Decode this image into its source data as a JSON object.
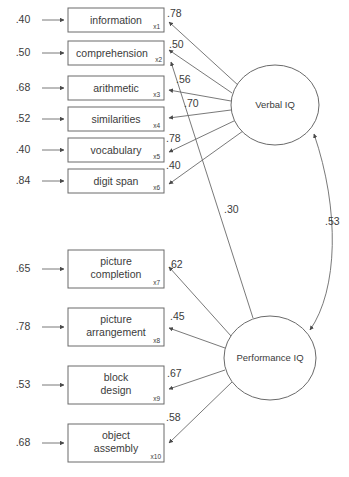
{
  "diagram": {
    "type": "sem-path-diagram",
    "colors": {
      "stroke": "#6a6a6a",
      "text": "#3b3b3b",
      "background": "#ffffff"
    },
    "factors": [
      {
        "id": "verbal",
        "label": "Verbal IQ",
        "cx": 275,
        "cy": 105,
        "rx": 44,
        "ry": 40
      },
      {
        "id": "performance",
        "label": "Performance IQ",
        "cx": 270,
        "cy": 358,
        "rx": 46,
        "ry": 42
      }
    ],
    "indicators": [
      {
        "id": "x1",
        "label": "information",
        "label2": "",
        "sub": "x1",
        "residual": ".40",
        "loading": ".78",
        "x": 68,
        "y": 8,
        "w": 96,
        "h": 24
      },
      {
        "id": "x2",
        "label": "comprehension",
        "label2": "",
        "sub": "x2",
        "residual": ".50",
        "loading": ".50",
        "x": 68,
        "y": 41,
        "w": 96,
        "h": 24
      },
      {
        "id": "x3",
        "label": "arithmetic",
        "label2": "",
        "sub": "x3",
        "residual": ".68",
        "loading": ".56",
        "x": 68,
        "y": 76,
        "w": 96,
        "h": 24
      },
      {
        "id": "x4",
        "label": "similarities",
        "label2": "",
        "sub": "x4",
        "residual": ".52",
        "loading": ".70",
        "x": 68,
        "y": 107,
        "w": 96,
        "h": 24
      },
      {
        "id": "x5",
        "label": "vocabulary",
        "label2": "",
        "sub": "x5",
        "residual": ".40",
        "loading": ".78",
        "x": 68,
        "y": 138,
        "w": 96,
        "h": 24
      },
      {
        "id": "x6",
        "label": "digit span",
        "label2": "",
        "sub": "x6",
        "residual": ".84",
        "loading": ".40",
        "x": 68,
        "y": 169,
        "w": 96,
        "h": 24
      },
      {
        "id": "x7",
        "label": "picture",
        "label2": "completion",
        "sub": "x7",
        "residual": ".65",
        "loading": ".62",
        "x": 68,
        "y": 250,
        "w": 96,
        "h": 38
      },
      {
        "id": "x8",
        "label": "picture",
        "label2": "arrangement",
        "sub": "x8",
        "residual": ".78",
        "loading": ".45",
        "x": 68,
        "y": 308,
        "w": 96,
        "h": 38
      },
      {
        "id": "x9",
        "label": "block",
        "label2": "design",
        "sub": "x9",
        "residual": ".53",
        "loading": ".67",
        "x": 68,
        "y": 366,
        "w": 96,
        "h": 38
      },
      {
        "id": "x10",
        "label": "object",
        "label2": "assembly",
        "sub": "x10",
        "residual": ".68",
        "loading": ".58",
        "x": 68,
        "y": 424,
        "w": 96,
        "h": 38
      }
    ],
    "cross_loading": {
      "from": "performance",
      "to": "x2",
      "value": ".30"
    },
    "correlation": {
      "between": [
        "verbal",
        "performance"
      ],
      "value": ".53"
    }
  }
}
